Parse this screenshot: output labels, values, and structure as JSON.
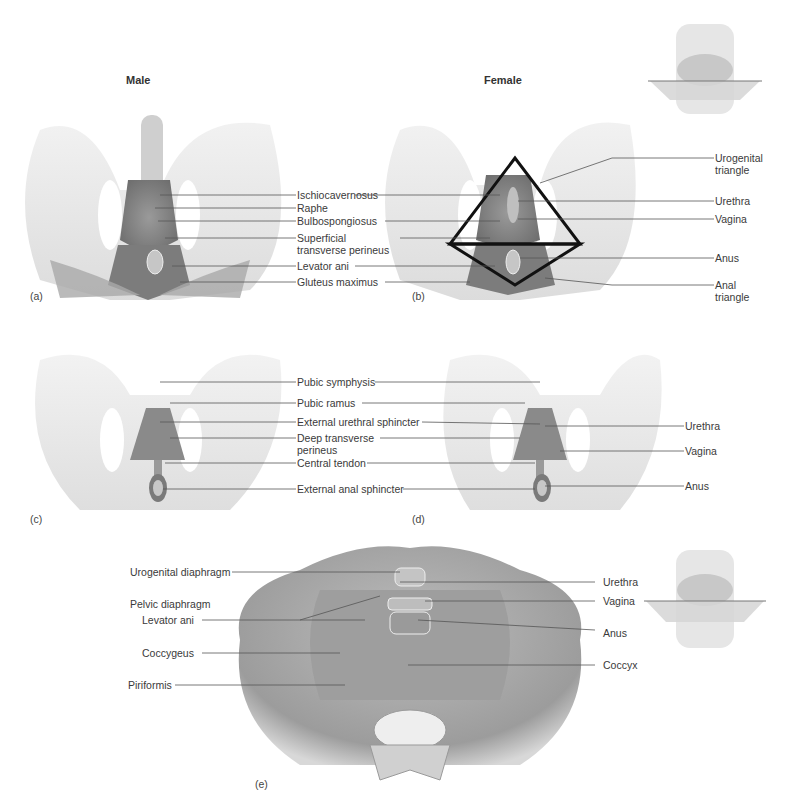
{
  "figure": {
    "headings": {
      "male": "Male",
      "female": "Female"
    },
    "panels": {
      "a": {
        "letter": "(a)"
      },
      "b": {
        "letter": "(b)"
      },
      "c": {
        "letter": "(c)"
      },
      "d": {
        "letter": "(d)"
      },
      "e": {
        "letter": "(e)"
      }
    },
    "ab_center_labels": [
      "Ischiocavernosus",
      "Raphe",
      "Bulbospongiosus",
      "Superficial transverse perineus",
      "Levator ani",
      "Gluteus maximus"
    ],
    "b_right_labels": [
      "Urogenital triangle",
      "Urethra",
      "Vagina",
      "Anus",
      "Anal triangle"
    ],
    "cd_center_labels": [
      "Pubic symphysis",
      "Pubic ramus",
      "External urethral sphincter",
      "Deep transverse perineus",
      "Central tendon",
      "External anal sphincter"
    ],
    "d_right_labels": [
      "Urethra",
      "Vagina",
      "Anus"
    ],
    "e_left_labels": [
      "Urogenital diaphragm",
      "Pelvic diaphragm",
      "Levator ani",
      "Coccygeus",
      "Piriformis"
    ],
    "e_right_labels": [
      "Urethra",
      "Vagina",
      "Anus",
      "Coccyx"
    ]
  }
}
